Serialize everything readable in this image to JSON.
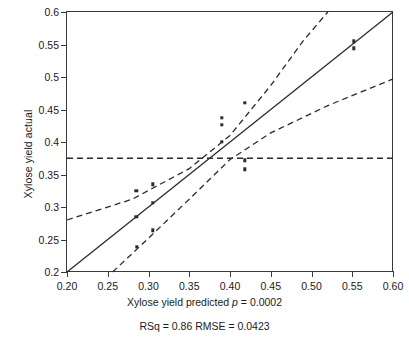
{
  "chart_data": {
    "type": "scatter",
    "title": "",
    "xlabel": "Xylose yield predicted p = 0.0002",
    "ylabel": "Xylose yield actual",
    "xlim": [
      0.2,
      0.6
    ],
    "ylim": [
      0.2,
      0.6
    ],
    "xticks": [
      "0.20",
      "0.25",
      "0.30",
      "0.35",
      "0.40",
      "0.45",
      "0.50",
      "0.55",
      "0.60"
    ],
    "xtick_values": [
      0.2,
      0.25,
      0.3,
      0.35,
      0.4,
      0.45,
      0.5,
      0.55,
      0.6
    ],
    "yticks": [
      "0.2",
      "0.25",
      "0.3",
      "0.35",
      "0.4",
      "0.45",
      "0.5",
      "0.55",
      "0.6"
    ],
    "ytick_values": [
      0.2,
      0.25,
      0.3,
      0.35,
      0.4,
      0.45,
      0.5,
      0.55,
      0.6
    ],
    "grid": false,
    "legend": "none",
    "points": [
      {
        "x": 0.285,
        "y": 0.325
      },
      {
        "x": 0.285,
        "y": 0.285
      },
      {
        "x": 0.286,
        "y": 0.239
      },
      {
        "x": 0.305,
        "y": 0.335
      },
      {
        "x": 0.305,
        "y": 0.306
      },
      {
        "x": 0.305,
        "y": 0.264
      },
      {
        "x": 0.39,
        "y": 0.437
      },
      {
        "x": 0.39,
        "y": 0.426
      },
      {
        "x": 0.39,
        "y": 0.4
      },
      {
        "x": 0.418,
        "y": 0.46
      },
      {
        "x": 0.418,
        "y": 0.372
      },
      {
        "x": 0.418,
        "y": 0.358
      },
      {
        "x": 0.552,
        "y": 0.555
      },
      {
        "x": 0.552,
        "y": 0.544
      }
    ],
    "fit_line": {
      "style": "solid",
      "x": [
        0.2,
        0.6
      ],
      "y": [
        0.2,
        0.6
      ]
    },
    "mean_line": {
      "style": "dashed",
      "orientation": "horizontal",
      "y": 0.375
    },
    "confidence_bands": [
      {
        "name": "upper-confidence-band",
        "style": "dashed",
        "x": [
          0.2,
          0.28,
          0.35,
          0.4,
          0.45,
          0.49,
          0.52
        ],
        "y": [
          0.28,
          0.312,
          0.359,
          0.41,
          0.487,
          0.556,
          0.6
        ]
      },
      {
        "name": "lower-confidence-band",
        "style": "dashed",
        "x": [
          0.256,
          0.3,
          0.35,
          0.4,
          0.45,
          0.52,
          0.6
        ],
        "y": [
          0.2,
          0.252,
          0.312,
          0.373,
          0.414,
          0.456,
          0.497
        ]
      }
    ],
    "annotations": {
      "p_value_label": "Xylose yield predicted",
      "p_symbol": "p",
      "p_value": "= 0.0002",
      "stats_line": "RSq = 0.86 RMSE = 0.0423",
      "rsq": "0.86",
      "rmse": "0.0423"
    },
    "colors": {
      "axis": "#3a3a3a",
      "point": "#2b2b2b",
      "fit_line": "#2b2b2b",
      "band": "#2b2b2b",
      "background": "#ffffff"
    }
  }
}
